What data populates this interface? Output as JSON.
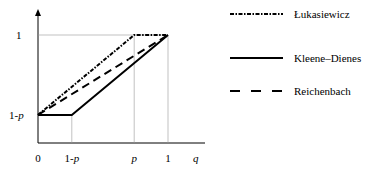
{
  "chart_data": {
    "type": "line",
    "title": "",
    "xlabel": "q",
    "ylabel": "",
    "parameter_p": 0.74,
    "xlim": [
      0,
      1
    ],
    "ylim": [
      0,
      1
    ],
    "x_ticks": [
      {
        "label": "0",
        "value": 0
      },
      {
        "label": "1-p",
        "value": 0.26
      },
      {
        "label": "p",
        "value": 0.74
      },
      {
        "label": "1",
        "value": 1
      }
    ],
    "y_ticks": [
      {
        "label": "1-p",
        "value": 0.26
      },
      {
        "label": "1",
        "value": 1
      }
    ],
    "series": [
      {
        "name": "Łukasiewicz",
        "style": "dash-dot",
        "points": [
          [
            0,
            0.26
          ],
          [
            0.74,
            1
          ],
          [
            1,
            1
          ]
        ]
      },
      {
        "name": "Kleene–Dienes",
        "style": "solid",
        "points": [
          [
            0,
            0.26
          ],
          [
            0.26,
            0.26
          ],
          [
            1,
            1
          ]
        ]
      },
      {
        "name": "Reichenbach",
        "style": "dashed",
        "points": [
          [
            0,
            0.26
          ],
          [
            1,
            1
          ]
        ]
      }
    ],
    "legend_position": "right",
    "grid": false
  }
}
